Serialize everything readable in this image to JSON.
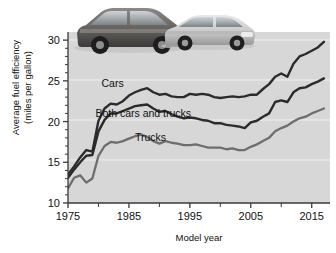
{
  "chart_data": {
    "type": "line",
    "title": "",
    "xlabel": "Model year",
    "ylabel": "Average fuel efficiency (miles per gallon)",
    "ylabel_line1": "Average fuel efficiency",
    "ylabel_line2": "(miles per gallon)",
    "xlim": [
      1975,
      2018
    ],
    "ylim": [
      10,
      31
    ],
    "yticks": [
      15,
      20,
      25,
      30
    ],
    "ytick_labels": [
      "15",
      "20",
      "25",
      "30"
    ],
    "xticks": [
      1975,
      1985,
      1995,
      2005,
      2015
    ],
    "xtick_labels": [
      "1975",
      "1985",
      "1995",
      "2005",
      "2015"
    ],
    "xminor_ticks": [
      1980,
      1990,
      2000,
      2010
    ],
    "grid": "horizontal-light",
    "legend": "inline-annotations",
    "x": [
      1975,
      1976,
      1977,
      1978,
      1979,
      1980,
      1981,
      1982,
      1983,
      1984,
      1985,
      1986,
      1987,
      1988,
      1989,
      1990,
      1991,
      1992,
      1993,
      1994,
      1995,
      1996,
      1997,
      1998,
      1999,
      2000,
      2001,
      2002,
      2003,
      2004,
      2005,
      2006,
      2007,
      2008,
      2009,
      2010,
      2011,
      2012,
      2013,
      2014,
      2015,
      2016,
      2017
    ],
    "series": [
      {
        "name": "Cars",
        "color": "#2b2b2b",
        "label": "Cars",
        "values": [
          13.5,
          14.5,
          15.6,
          16.5,
          16.3,
          20.1,
          21.6,
          22.2,
          22.1,
          22.5,
          23.2,
          23.6,
          23.9,
          24.1,
          23.6,
          23.3,
          23.4,
          23.1,
          23.0,
          23.0,
          23.4,
          23.3,
          23.4,
          23.3,
          23.0,
          22.9,
          23.0,
          23.1,
          23.0,
          23.1,
          23.3,
          23.3,
          24.0,
          24.6,
          25.5,
          25.9,
          25.5,
          27.1,
          28.0,
          28.3,
          28.7,
          29.1,
          29.8
        ]
      },
      {
        "name": "Both cars and trucks",
        "color": "#2b2b2b",
        "label": "Both cars and trucks",
        "values": [
          13.1,
          14.1,
          15.0,
          15.8,
          15.9,
          18.8,
          20.2,
          21.0,
          21.0,
          21.3,
          21.6,
          21.9,
          22.0,
          22.1,
          21.6,
          21.2,
          21.3,
          20.9,
          20.6,
          20.4,
          20.5,
          20.4,
          20.2,
          20.1,
          19.8,
          19.8,
          19.6,
          19.5,
          19.4,
          19.2,
          19.9,
          20.1,
          20.6,
          21.0,
          22.4,
          22.6,
          22.4,
          23.6,
          24.1,
          24.2,
          24.6,
          24.9,
          25.3
        ]
      },
      {
        "name": "Trucks",
        "color": "#6e6e6e",
        "label": "Trucks",
        "values": [
          11.8,
          13.1,
          13.4,
          12.5,
          13.0,
          15.8,
          17.0,
          17.5,
          17.4,
          17.6,
          17.9,
          18.2,
          18.4,
          18.1,
          17.6,
          17.3,
          17.6,
          17.4,
          17.3,
          17.1,
          17.1,
          17.2,
          17.0,
          16.8,
          16.8,
          16.8,
          16.6,
          16.7,
          16.5,
          16.5,
          16.9,
          17.2,
          17.6,
          18.0,
          18.8,
          19.2,
          19.5,
          20.0,
          20.4,
          20.6,
          21.0,
          21.3,
          21.6
        ]
      }
    ],
    "annotations": [
      {
        "text": "Cars",
        "x": 1980.5,
        "y": 24.2
      },
      {
        "text": "Both cars and trucks",
        "x": 1979.5,
        "y": 20.6
      },
      {
        "text": "Trucks",
        "x": 1986.0,
        "y": 17.6
      }
    ],
    "colors": {
      "plot_background": "#d7d7d7",
      "page_background": "#ffffff",
      "axis": "#3a3a3a",
      "gridline": "#efefef",
      "cars_line": "#2b2b2b",
      "both_line": "#2b2b2b",
      "trucks_line": "#6e6e6e",
      "text": "#111111"
    },
    "images": [
      {
        "name": "suv-photo",
        "description": "dark sport utility vehicle"
      },
      {
        "name": "sedan-photo",
        "description": "light silver sedan"
      }
    ]
  }
}
